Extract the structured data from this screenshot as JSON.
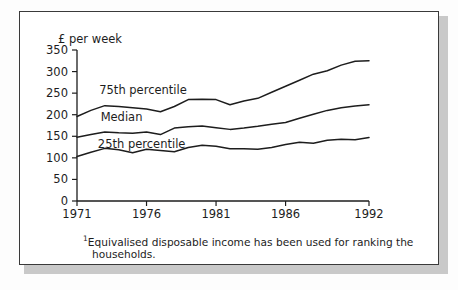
{
  "figure": {
    "background_color": "#ffffff",
    "frame_color": "#3a3a3a",
    "shadow_color": "#c9c9c9",
    "line_color": "#1d1d1d"
  },
  "footnote": {
    "marker": "1",
    "line1": "Equivalised disposable income has been used for ranking the",
    "line2": "households."
  },
  "chart_data": {
    "type": "line",
    "title": "",
    "subtitle": "",
    "xlabel": "",
    "ylabel": "£ per week",
    "ylim": [
      0,
      350
    ],
    "xlim": [
      1971,
      1992
    ],
    "grid": false,
    "legend_position": "inline-annotations",
    "yticks": [
      0,
      50,
      100,
      150,
      200,
      250,
      300,
      350
    ],
    "ytick_labels": [
      "0",
      "50",
      "100",
      "150",
      "200",
      "250",
      "300",
      "350"
    ],
    "xticks": [
      1971,
      1976,
      1981,
      1986,
      1992
    ],
    "xtick_labels": [
      "1971",
      "1976",
      "1981",
      "1986",
      "1992"
    ],
    "x": [
      1971,
      1972,
      1973,
      1974,
      1975,
      1976,
      1977,
      1978,
      1979,
      1980,
      1981,
      1982,
      1983,
      1984,
      1985,
      1986,
      1987,
      1988,
      1989,
      1990,
      1991,
      1992
    ],
    "series": [
      {
        "name": "75th percentile",
        "label": "75th percentile",
        "label_x": 1972.6,
        "label_y": 248,
        "values": [
          196,
          210,
          221,
          219,
          216,
          213,
          207,
          219,
          235,
          236,
          235,
          223,
          232,
          238,
          252,
          266,
          280,
          294,
          302,
          315,
          324,
          325
        ]
      },
      {
        "name": "Median",
        "label": "Median",
        "label_x": 1972.7,
        "label_y": 186,
        "values": [
          148,
          154,
          160,
          158,
          157,
          160,
          154,
          169,
          172,
          174,
          170,
          166,
          169,
          173,
          178,
          182,
          192,
          201,
          210,
          216,
          220,
          223
        ]
      },
      {
        "name": "25th percentile",
        "label": "25th percentile",
        "label_x": 1972.5,
        "label_y": 124,
        "values": [
          103,
          113,
          122,
          119,
          112,
          120,
          117,
          114,
          124,
          129,
          127,
          121,
          121,
          120,
          124,
          131,
          136,
          134,
          141,
          143,
          142,
          147
        ]
      }
    ]
  }
}
